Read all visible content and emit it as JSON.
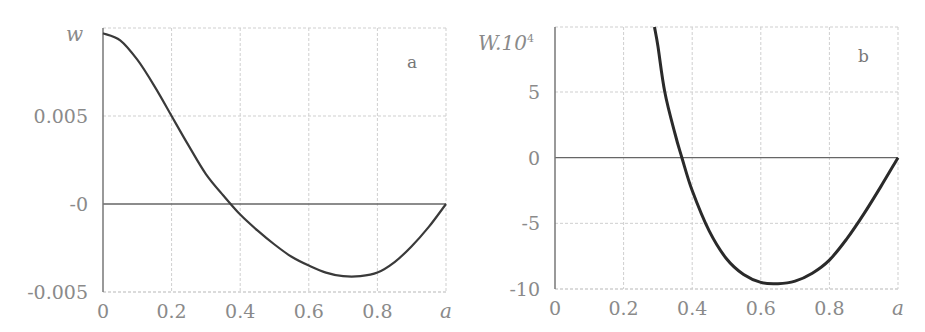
{
  "chart_data": [
    {
      "type": "line",
      "panel_label": "a",
      "title": "",
      "xlabel": "a",
      "ylabel": "w",
      "xlim": [
        0,
        1
      ],
      "ylim": [
        -0.005,
        0.0098
      ],
      "x_ticks": [
        "0",
        "0.2",
        "0.4",
        "0.6",
        "0.8",
        "a"
      ],
      "y_ticks": [
        "-0.005",
        "-0",
        "0.005"
      ],
      "y_tick_values": [
        -0.005,
        0,
        0.005
      ],
      "grid": true,
      "series": [
        {
          "name": "w",
          "x": [
            0,
            0.05,
            0.1,
            0.15,
            0.2,
            0.25,
            0.3,
            0.35,
            0.4,
            0.45,
            0.5,
            0.55,
            0.6,
            0.65,
            0.7,
            0.75,
            0.8,
            0.85,
            0.9,
            0.95,
            1.0
          ],
          "values": [
            0.0097,
            0.0093,
            0.0082,
            0.0067,
            0.005,
            0.0033,
            0.0017,
            0.0005,
            -0.0006,
            -0.0015,
            -0.0023,
            -0.003,
            -0.0035,
            -0.0039,
            -0.0041,
            -0.0041,
            -0.0039,
            -0.0033,
            -0.0024,
            -0.0013,
            0.0
          ]
        }
      ]
    },
    {
      "type": "line",
      "panel_label": "b",
      "title": "",
      "xlabel": "a",
      "ylabel": "W.10⁴",
      "xlim": [
        0,
        1
      ],
      "ylim": [
        -10,
        10.2
      ],
      "x_ticks": [
        "0",
        "0.2",
        "0.4",
        "0.6",
        "0.8",
        "a"
      ],
      "y_ticks": [
        "-10",
        "-5",
        "0",
        "5"
      ],
      "y_tick_values": [
        -10,
        -5,
        0,
        5
      ],
      "grid": true,
      "series": [
        {
          "name": "W·10^4",
          "x": [
            0.29,
            0.3,
            0.32,
            0.35,
            0.37,
            0.4,
            0.45,
            0.5,
            0.55,
            0.6,
            0.65,
            0.7,
            0.75,
            0.8,
            0.85,
            0.9,
            0.95,
            1.0
          ],
          "values": [
            10.2,
            8.5,
            5.0,
            1.8,
            0.0,
            -2.5,
            -5.6,
            -7.7,
            -8.9,
            -9.5,
            -9.6,
            -9.4,
            -8.8,
            -7.8,
            -6.2,
            -4.3,
            -2.2,
            0.0
          ]
        }
      ]
    }
  ]
}
